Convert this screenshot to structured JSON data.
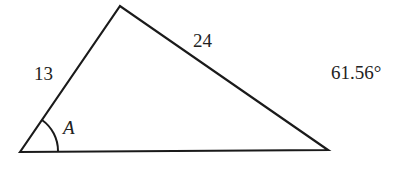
{
  "diagram": {
    "type": "triangle",
    "vertices": {
      "left": [
        20,
        152
      ],
      "top": [
        120,
        6
      ],
      "right": [
        328,
        150
      ]
    },
    "side_labels": {
      "left_side": "13",
      "top_right_side": "24"
    },
    "angle_label": "A",
    "angle_value": "61.56°",
    "stroke_color": "#1a1a1a"
  }
}
